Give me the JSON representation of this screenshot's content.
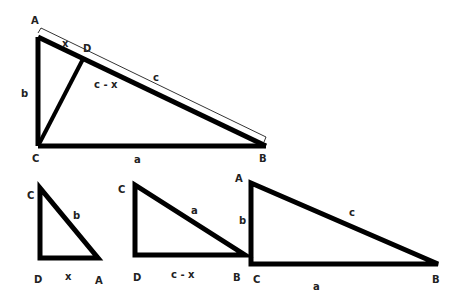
{
  "diagram": {
    "main": {
      "vertices": {
        "A": "A",
        "B": "B",
        "C": "C",
        "D": "D"
      },
      "sides": {
        "a": "a",
        "b": "b",
        "c": "c",
        "x": "x",
        "c_minus_x": "c - x"
      }
    },
    "small_left": {
      "vertices": {
        "C": "C",
        "D": "D",
        "A": "A"
      },
      "sides": {
        "hyp": "b",
        "base": "x"
      }
    },
    "small_middle": {
      "vertices": {
        "C": "C",
        "D": "D",
        "B": "B"
      },
      "sides": {
        "hyp": "a",
        "base": "c - x"
      }
    },
    "large_right": {
      "vertices": {
        "A": "A",
        "C": "C",
        "B": "B"
      },
      "sides": {
        "hyp": "c",
        "leg": "b",
        "base": "a"
      }
    },
    "colors": {
      "stroke": "#000000",
      "label": "#222222",
      "background": "#ffffff"
    }
  }
}
